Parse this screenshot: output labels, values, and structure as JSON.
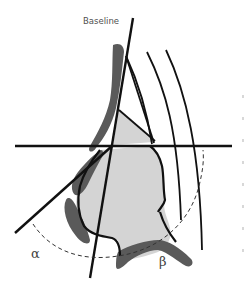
{
  "diagram": {
    "title_label": "Baseline",
    "angle_labels": {
      "alpha": "α",
      "beta": "β"
    },
    "colors": {
      "background": "#ffffff",
      "soft_tissue_fill": "#d4d4d4",
      "bone_cartilage_fill": "#5a5a5a",
      "lines": "#111111",
      "dashed_arc": "#333333",
      "text": "#505050"
    },
    "elements": [
      "baseline-line",
      "horizontal-reference-line",
      "alpha-angle-line",
      "three-concentric-arcs",
      "dashed-angle-arc",
      "nasal-profile-soft-tissue",
      "dark-bone-segments"
    ]
  }
}
